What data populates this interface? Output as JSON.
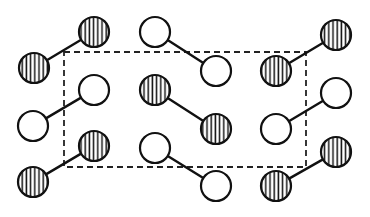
{
  "diagram": {
    "type": "crystal-lattice-molecular-packing",
    "colors": {
      "line": "#111111",
      "background": "#ffffff",
      "hatch": "#111111"
    },
    "atom_radius": 15,
    "unit_cell": {
      "x": 64,
      "y": 52,
      "width": 242,
      "height": 115,
      "style": "dashed"
    },
    "molecules": [
      {
        "id": "A",
        "fill": "hatched",
        "atoms": [
          [
            34,
            68
          ],
          [
            94,
            32
          ]
        ]
      },
      {
        "id": "B",
        "fill": "open",
        "atoms": [
          [
            155,
            32
          ],
          [
            216,
            71
          ]
        ]
      },
      {
        "id": "C",
        "fill": "hatched",
        "atoms": [
          [
            276,
            71
          ],
          [
            336,
            35
          ]
        ]
      },
      {
        "id": "D",
        "fill": "open",
        "atoms": [
          [
            33,
            126
          ],
          [
            94,
            90
          ]
        ]
      },
      {
        "id": "E",
        "fill": "hatched",
        "atoms": [
          [
            155,
            90
          ],
          [
            216,
            129
          ]
        ]
      },
      {
        "id": "F",
        "fill": "open",
        "atoms": [
          [
            276,
            129
          ],
          [
            336,
            93
          ]
        ]
      },
      {
        "id": "G",
        "fill": "hatched",
        "atoms": [
          [
            33,
            182
          ],
          [
            94,
            146
          ]
        ]
      },
      {
        "id": "H",
        "fill": "open",
        "atoms": [
          [
            155,
            148
          ],
          [
            216,
            186
          ]
        ]
      },
      {
        "id": "I",
        "fill": "hatched",
        "atoms": [
          [
            276,
            186
          ],
          [
            336,
            152
          ]
        ]
      }
    ]
  }
}
